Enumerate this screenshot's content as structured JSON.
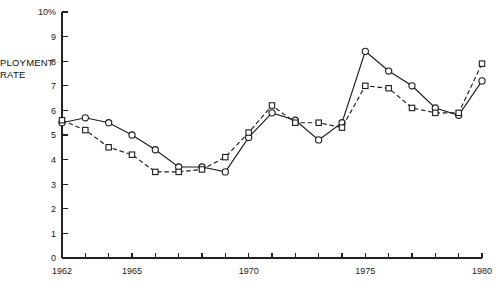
{
  "chart_data": {
    "type": "line",
    "title": "",
    "xlabel": "",
    "ylabel": "PLOYMENT RATE",
    "ylabel_lines": [
      "PLOYMENT",
      "RATE"
    ],
    "ylim": [
      0,
      10
    ],
    "xlim": [
      1962,
      1980
    ],
    "grid": false,
    "legend": "none",
    "y_tick_labels": [
      "10%",
      "9",
      "8",
      "7",
      "6",
      "5",
      "4",
      "3",
      "2",
      "1",
      "0"
    ],
    "y_ticks": [
      10,
      9,
      8,
      7,
      6,
      5,
      4,
      3,
      2,
      1,
      0
    ],
    "x_ticks": [
      1962,
      1963,
      1964,
      1965,
      1966,
      1967,
      1968,
      1969,
      1970,
      1971,
      1972,
      1973,
      1974,
      1975,
      1976,
      1977,
      1978,
      1979,
      1980
    ],
    "x_tick_labels": [
      {
        "year": 1962,
        "label": "1962"
      },
      {
        "year": 1965,
        "label": "1965"
      },
      {
        "year": 1970,
        "label": "1970"
      },
      {
        "year": 1975,
        "label": "1975"
      },
      {
        "year": 1980,
        "label": "1980"
      }
    ],
    "x": [
      1962,
      1963,
      1964,
      1965,
      1966,
      1967,
      1968,
      1969,
      1970,
      1971,
      1972,
      1973,
      1974,
      1975,
      1976,
      1977,
      1978,
      1979,
      1980
    ],
    "series": [
      {
        "name": "circle-series",
        "marker": "circle",
        "line_style": "solid",
        "values": [
          5.5,
          5.7,
          5.5,
          5.0,
          4.4,
          3.7,
          3.7,
          3.5,
          4.9,
          5.9,
          5.6,
          4.8,
          5.5,
          8.4,
          7.6,
          7.0,
          6.1,
          5.8,
          7.2
        ]
      },
      {
        "name": "square-series",
        "marker": "square",
        "line_style": "dashed",
        "values": [
          5.6,
          5.2,
          4.5,
          4.2,
          3.5,
          3.5,
          3.6,
          4.1,
          5.1,
          6.2,
          5.5,
          5.5,
          5.3,
          7.0,
          6.9,
          6.1,
          5.9,
          5.9,
          7.9
        ]
      }
    ]
  },
  "geometry": {
    "plot_left": 62,
    "plot_right": 482,
    "plot_top": 12,
    "plot_bottom": 258,
    "y_tick_len": 6,
    "x_tick_len": 5
  }
}
